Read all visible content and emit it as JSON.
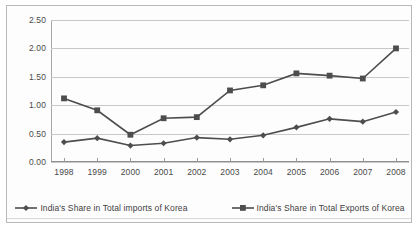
{
  "chart_data": {
    "type": "line",
    "title": "",
    "xlabel": "",
    "ylabel": "",
    "categories": [
      "1998",
      "1999",
      "2000",
      "2001",
      "2002",
      "2003",
      "2004",
      "2005",
      "2006",
      "2007",
      "2008"
    ],
    "ylim": [
      0.0,
      2.5
    ],
    "ytick_labels": [
      "0.00",
      "0.50",
      "1.00",
      "1.50",
      "2.00",
      "2.50"
    ],
    "ytick_values": [
      0.0,
      0.5,
      1.0,
      1.5,
      2.0,
      2.5
    ],
    "grid": true,
    "legend_position": "bottom",
    "series": [
      {
        "name": "India's Share in Total imports of Korea",
        "marker": "diamond",
        "color": "#4d4d4d",
        "values": [
          0.35,
          0.42,
          0.29,
          0.33,
          0.43,
          0.4,
          0.47,
          0.61,
          0.76,
          0.71,
          0.88
        ]
      },
      {
        "name": "India's Share in Total Exports of Korea",
        "marker": "square",
        "color": "#4d4d4d",
        "values": [
          1.12,
          0.91,
          0.48,
          0.77,
          0.79,
          1.26,
          1.35,
          1.56,
          1.52,
          1.47,
          2.0
        ]
      }
    ]
  },
  "legend": {
    "items": [
      {
        "label": "India's Share in Total imports of Korea",
        "marker": "diamond"
      },
      {
        "label": "India's Share in Total Exports of Korea",
        "marker": "square"
      }
    ]
  },
  "style": {
    "line_color": "#4d4d4d",
    "grid_color": "#c8c8c8",
    "border_color": "#b9b9b9",
    "background": "#fdfdfd",
    "text_color": "#4a4a4a"
  }
}
